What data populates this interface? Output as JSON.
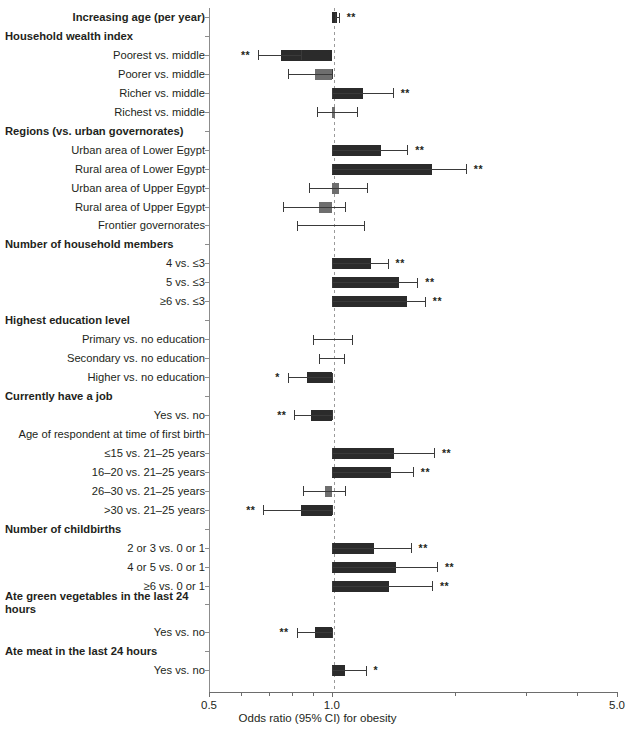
{
  "chart_data": {
    "type": "bar",
    "title": "",
    "xlabel": "Odds ratio (95% CI) for obesity",
    "ylabel": "",
    "xscale": "log",
    "xlim": [
      0.5,
      5.0
    ],
    "reference_line": 1.0,
    "tick_labels": [
      "0.5",
      "1.0",
      "5.0"
    ],
    "tick_values": [
      0.5,
      1.0,
      5.0
    ],
    "grid": false,
    "legend": "none",
    "significance_notes": {
      "**": "p < 0.01",
      "*": "p < 0.05"
    },
    "colors": {
      "significant": "#2b2b2b",
      "non_significant": "#6e6e6e",
      "reference_line": "#9a9a9a",
      "axis": "#8c8c8c"
    },
    "rows": [
      {
        "label": "Increasing age (per year)",
        "type": "header-with-data",
        "or": 1.03,
        "ci_low": 1.02,
        "ci_high": 1.04,
        "sig": "**",
        "sig_side": "right",
        "color": "significant"
      },
      {
        "label": "Household wealth index",
        "type": "header"
      },
      {
        "label": "Poorest vs. middle",
        "type": "data",
        "or": 0.75,
        "ci_low": 0.66,
        "ci_high": 0.84,
        "sig": "**",
        "sig_side": "left",
        "color": "significant"
      },
      {
        "label": "Poorer vs. middle",
        "type": "data",
        "or": 0.91,
        "ci_low": 0.78,
        "ci_high": 1.0,
        "sig": "",
        "sig_side": "",
        "color": "non_significant"
      },
      {
        "label": "Richer vs. middle",
        "type": "data",
        "or": 1.19,
        "ci_low": 1.0,
        "ci_high": 1.41,
        "sig": "**",
        "sig_side": "right",
        "color": "significant"
      },
      {
        "label": "Richest vs. middle",
        "type": "data",
        "or": 1.02,
        "ci_low": 0.92,
        "ci_high": 1.15,
        "sig": "",
        "sig_side": "",
        "color": "non_significant"
      },
      {
        "label": "Regions (vs. urban governorates)",
        "type": "header"
      },
      {
        "label": "Urban area of Lower Egypt",
        "type": "data",
        "or": 1.32,
        "ci_low": 1.0,
        "ci_high": 1.53,
        "sig": "**",
        "sig_side": "right",
        "color": "significant"
      },
      {
        "label": "Rural area of Lower Egypt",
        "type": "data",
        "or": 1.76,
        "ci_low": 1.0,
        "ci_high": 2.13,
        "sig": "**",
        "sig_side": "right",
        "color": "significant"
      },
      {
        "label": "Urban area of Upper Egypt",
        "type": "data",
        "or": 1.04,
        "ci_low": 0.88,
        "ci_high": 1.22,
        "sig": "",
        "sig_side": "",
        "color": "non_significant"
      },
      {
        "label": "Rural area of Upper Egypt",
        "type": "data",
        "or": 0.93,
        "ci_low": 0.76,
        "ci_high": 1.08,
        "sig": "",
        "sig_side": "",
        "color": "non_significant"
      },
      {
        "label": "Frontier governorates",
        "type": "data",
        "or": 1.0,
        "ci_low": 0.82,
        "ci_high": 1.2,
        "sig": "",
        "sig_side": "",
        "color": "non_significant"
      },
      {
        "label": "Number of household members",
        "type": "header"
      },
      {
        "label": "4 vs. ≤3",
        "type": "data",
        "or": 1.25,
        "ci_low": 1.0,
        "ci_high": 1.37,
        "sig": "**",
        "sig_side": "right",
        "color": "significant"
      },
      {
        "label": "5 vs. ≤3",
        "type": "data",
        "or": 1.46,
        "ci_low": 1.0,
        "ci_high": 1.62,
        "sig": "**",
        "sig_side": "right",
        "color": "significant"
      },
      {
        "label": "≥6 vs. ≤3",
        "type": "data",
        "or": 1.53,
        "ci_low": 1.0,
        "ci_high": 1.69,
        "sig": "**",
        "sig_side": "right",
        "color": "significant"
      },
      {
        "label": "Highest education level",
        "type": "header"
      },
      {
        "label": "Primary vs. no education",
        "type": "data",
        "or": 1.0,
        "ci_low": 0.9,
        "ci_high": 1.12,
        "sig": "",
        "sig_side": "",
        "color": "non_significant"
      },
      {
        "label": "Secondary vs. no education",
        "type": "data",
        "or": 1.0,
        "ci_low": 0.93,
        "ci_high": 1.07,
        "sig": "",
        "sig_side": "",
        "color": "non_significant"
      },
      {
        "label": "Higher vs. no education",
        "type": "data",
        "or": 0.87,
        "ci_low": 0.78,
        "ci_high": 1.0,
        "sig": "*",
        "sig_side": "left",
        "color": "significant"
      },
      {
        "label": "Currently have a job",
        "type": "header"
      },
      {
        "label": "Yes vs. no",
        "type": "data",
        "or": 0.89,
        "ci_low": 0.81,
        "ci_high": 1.0,
        "sig": "**",
        "sig_side": "left",
        "color": "significant"
      },
      {
        "label": "Age of respondent at time of first birth",
        "type": "header-plain"
      },
      {
        "label": "≤15 vs. 21–25 years",
        "type": "data",
        "or": 1.42,
        "ci_low": 1.0,
        "ci_high": 1.78,
        "sig": "**",
        "sig_side": "right",
        "color": "significant"
      },
      {
        "label": "16–20 vs. 21–25 years",
        "type": "data",
        "or": 1.4,
        "ci_low": 1.0,
        "ci_high": 1.58,
        "sig": "**",
        "sig_side": "right",
        "color": "significant"
      },
      {
        "label": "26–30 vs. 21–25 years",
        "type": "data",
        "or": 0.96,
        "ci_low": 0.85,
        "ci_high": 1.08,
        "sig": "",
        "sig_side": "",
        "color": "non_significant"
      },
      {
        "label": ">30 vs. 21–25 years",
        "type": "data",
        "or": 0.84,
        "ci_low": 0.68,
        "ci_high": 1.0,
        "sig": "**",
        "sig_side": "left",
        "color": "significant"
      },
      {
        "label": "Number of childbirths",
        "type": "header"
      },
      {
        "label": "2 or 3 vs. 0 or 1",
        "type": "data",
        "or": 1.27,
        "ci_low": 1.0,
        "ci_high": 1.56,
        "sig": "**",
        "sig_side": "right",
        "color": "significant"
      },
      {
        "label": "4 or 5 vs. 0 or 1",
        "type": "data",
        "or": 1.44,
        "ci_low": 1.0,
        "ci_high": 1.81,
        "sig": "**",
        "sig_side": "right",
        "color": "significant"
      },
      {
        "label": "≥6 vs. 0 or 1",
        "type": "data",
        "or": 1.38,
        "ci_low": 1.0,
        "ci_high": 1.76,
        "sig": "**",
        "sig_side": "right",
        "color": "significant"
      },
      {
        "label": "Ate green vegetables in the last 24 hours",
        "type": "header2"
      },
      {
        "label": "Yes vs. no",
        "type": "data",
        "or": 0.91,
        "ci_low": 0.82,
        "ci_high": 1.0,
        "sig": "**",
        "sig_side": "left",
        "color": "significant"
      },
      {
        "label": "Ate meat in the last 24 hours",
        "type": "header"
      },
      {
        "label": "Yes vs. no",
        "type": "data",
        "or": 1.08,
        "ci_low": 1.0,
        "ci_high": 1.21,
        "sig": "*",
        "sig_side": "right",
        "color": "significant"
      }
    ]
  }
}
